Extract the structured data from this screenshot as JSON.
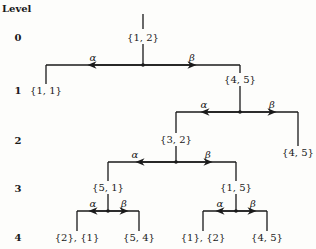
{
  "diagram": {
    "level_header": "Level",
    "levels": [
      "0",
      "1",
      "2",
      "3",
      "4"
    ],
    "edge_labels": {
      "alpha": "α",
      "beta": "β"
    },
    "nodes": {
      "root": "{1, 2}",
      "l1_left": "{1, 1}",
      "l1_right": "{4, 5}",
      "l2_left": "{3, 2}",
      "l2_right": "{4, 5}",
      "l3_left": "{5, 1}",
      "l3_right": "{1, 5}",
      "l4_a": "{2}, {1}",
      "l4_b": "{5, 4}",
      "l4_c": "{1}, {2}",
      "l4_d": "{4, 5}"
    }
  }
}
